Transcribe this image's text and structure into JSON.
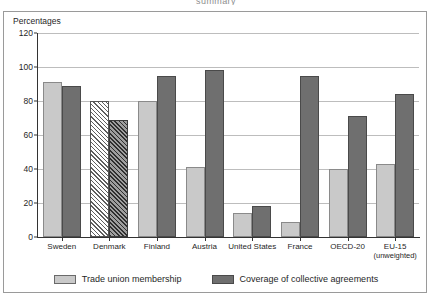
{
  "cut_off_header": "summary",
  "frame": {
    "axis_title": "Percentages"
  },
  "legend": {
    "items": [
      {
        "label": "Trade union membership",
        "swatch": "light-gray-swatch",
        "color": "#c9c9c9"
      },
      {
        "label": "Coverage of collective agreements",
        "swatch": "dark-gray-swatch",
        "color": "#6f6f6f"
      }
    ]
  },
  "chart_data": {
    "type": "bar",
    "title": "Percentages",
    "xlabel": "",
    "ylabel": "Percentages",
    "ylim": [
      0,
      120
    ],
    "yticks": [
      0,
      20,
      40,
      60,
      80,
      100,
      120
    ],
    "grid": true,
    "legend_position": "bottom",
    "categories": [
      "Sweden",
      "Denmark",
      "Finland",
      "Austria",
      "United States",
      "France",
      "OECD-20",
      "EU-15 (unweighted)"
    ],
    "category_labels": [
      {
        "line1": "Sweden",
        "line2": ""
      },
      {
        "line1": "Denmark",
        "line2": ""
      },
      {
        "line1": "Finland",
        "line2": ""
      },
      {
        "line1": "Austria",
        "line2": ""
      },
      {
        "line1": "United States",
        "line2": ""
      },
      {
        "line1": "France",
        "line2": ""
      },
      {
        "line1": "OECD-20",
        "line2": ""
      },
      {
        "line1": "EU-15",
        "line2": "(unweighted)"
      }
    ],
    "series": [
      {
        "name": "Trade union membership",
        "color": "#c9c9c9",
        "values": [
          91,
          80,
          80,
          41,
          14,
          9,
          40,
          43
        ]
      },
      {
        "name": "Coverage of collective agreements",
        "color": "#6f6f6f",
        "values": [
          89,
          69,
          95,
          98,
          18,
          95,
          71,
          84
        ]
      }
    ],
    "hatched_categories": [
      "Denmark"
    ]
  }
}
